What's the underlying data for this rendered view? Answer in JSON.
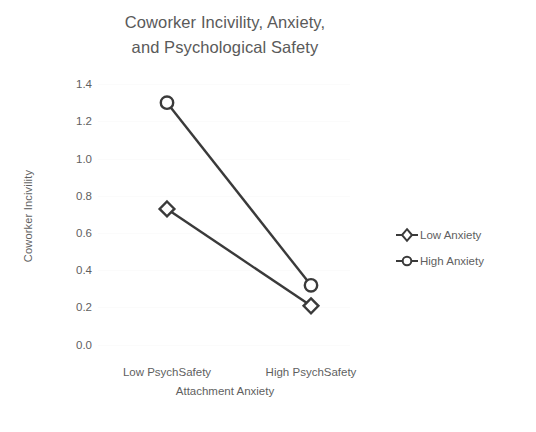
{
  "chart_data": {
    "type": "line",
    "title": "Coworker Incivility, Anxiety, and Psychological Safety",
    "title_lines": [
      "Coworker Incivility, Anxiety,",
      "and Psychological Safety"
    ],
    "xlabel": "Attachment Anxiety",
    "ylabel": "Coworker Incivility",
    "categories": [
      "Low PsychSafety",
      "High PsychSafety"
    ],
    "ylim": [
      0.0,
      1.4
    ],
    "yticks": [
      "0.0",
      "0.2",
      "0.4",
      "0.6",
      "0.8",
      "1.0",
      "1.2",
      "1.4"
    ],
    "ytick_values": [
      0.0,
      0.2,
      0.4,
      0.6,
      0.8,
      1.0,
      1.2,
      1.4
    ],
    "grid": false,
    "legend_position": "right",
    "series": [
      {
        "name": "Low Anxiety",
        "marker": "diamond",
        "color": "#3a3a3a",
        "values": [
          0.73,
          0.21
        ]
      },
      {
        "name": "High Anxiety",
        "marker": "circle",
        "color": "#3a3a3a",
        "values": [
          1.3,
          0.32
        ]
      }
    ]
  },
  "legend": {
    "items": [
      {
        "label": "Low Anxiety",
        "marker": "diamond"
      },
      {
        "label": "High Anxiety",
        "marker": "circle"
      }
    ]
  },
  "colors": {
    "background": "#ffffff",
    "text": "#5f5f5f",
    "title": "#5a5a5a",
    "line": "#3a3a3a",
    "gridline": "#fbfbfb"
  }
}
